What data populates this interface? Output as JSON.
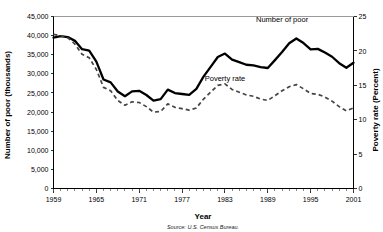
{
  "chart_data": {
    "type": "line",
    "title": "",
    "xlabel": "Year",
    "ylabel": "Number of poor (thousands)",
    "y2label": "Poverty rate (Percent)",
    "source": "Source: U.S. Census Bureau.",
    "xlim": [
      1959,
      2001
    ],
    "ylim": [
      0,
      45000
    ],
    "y2lim": [
      0,
      25
    ],
    "grid": false,
    "legend_position": "inline-annotation",
    "xticks": [
      1959,
      1965,
      1971,
      1977,
      1983,
      1989,
      1995,
      2001
    ],
    "xtick_labels": [
      "1959",
      "1965",
      "1971",
      "1977",
      "1983",
      "1989",
      "1995",
      "2001"
    ],
    "yticks": [
      0,
      5000,
      10000,
      15000,
      20000,
      25000,
      30000,
      35000,
      40000,
      45000
    ],
    "ytick_labels": [
      "0",
      "5,000",
      "10,000",
      "15,000",
      "20,000",
      "25,000",
      "30,000",
      "35,000",
      "40,000",
      "45,000"
    ],
    "y2ticks": [
      0,
      5,
      10,
      15,
      20,
      25
    ],
    "y2tick_labels": [
      "0",
      "5",
      "10",
      "15",
      "20",
      "25"
    ],
    "x": [
      1959,
      1960,
      1961,
      1962,
      1963,
      1964,
      1965,
      1966,
      1967,
      1968,
      1969,
      1970,
      1971,
      1972,
      1973,
      1974,
      1975,
      1976,
      1977,
      1978,
      1979,
      1980,
      1981,
      1982,
      1983,
      1984,
      1985,
      1986,
      1987,
      1988,
      1989,
      1990,
      1991,
      1992,
      1993,
      1994,
      1995,
      1996,
      1997,
      1998,
      1999,
      2000,
      2001
    ],
    "series": [
      {
        "name": "Number of poor",
        "axis": "left",
        "style": "solid",
        "label_text": "Number of poor",
        "label_x": 1991,
        "label_y": 43600,
        "values": [
          39490,
          39851,
          39628,
          38625,
          36436,
          36055,
          33185,
          28510,
          27769,
          25389,
          24147,
          25420,
          25559,
          24460,
          22973,
          23370,
          25877,
          24975,
          24720,
          24497,
          26072,
          29272,
          31822,
          34398,
          35303,
          33700,
          33064,
          32370,
          32221,
          31745,
          31528,
          33585,
          35708,
          38014,
          39265,
          38059,
          36425,
          36529,
          35574,
          34476,
          32791,
          31581,
          32907
        ]
      },
      {
        "name": "Poverty rate",
        "axis": "right",
        "style": "dashed",
        "label_text": "Poverty rate",
        "label_x": 1983,
        "label_y": 15.6,
        "values": [
          22.4,
          22.2,
          21.9,
          21.0,
          19.5,
          19.0,
          17.3,
          14.7,
          14.2,
          12.8,
          12.1,
          12.6,
          12.5,
          11.9,
          11.1,
          11.2,
          12.3,
          11.8,
          11.6,
          11.4,
          11.7,
          13.0,
          14.0,
          15.0,
          15.2,
          14.4,
          14.0,
          13.6,
          13.4,
          13.0,
          12.8,
          13.5,
          14.2,
          14.8,
          15.1,
          14.5,
          13.8,
          13.7,
          13.3,
          12.7,
          11.9,
          11.3,
          11.7
        ]
      }
    ]
  }
}
